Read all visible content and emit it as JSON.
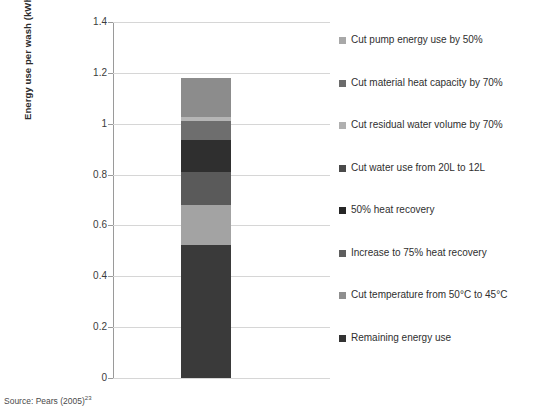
{
  "chart_data": {
    "type": "bar",
    "title": "",
    "xlabel": "",
    "ylabel": "Energy use per wash (kWh)",
    "ylim": [
      0,
      1.4
    ],
    "ytick_labels": [
      "1.4",
      "1.2",
      "1",
      "0.8",
      "0.6",
      "0.4",
      "0.2",
      "0"
    ],
    "ytick_values": [
      1.4,
      1.2,
      1.0,
      0.8,
      0.6,
      0.4,
      0.2,
      0
    ],
    "grid": true,
    "legend_position": "right",
    "stacked": true,
    "categories": [
      ""
    ],
    "total": 1.18,
    "series": [
      {
        "name": "Cut pump energy use by 50%",
        "values": [
          0.155
        ],
        "cumulative_top": 1.18,
        "color": "#8c8c8c"
      },
      {
        "name": "Cut material heat capacity by 70%",
        "values": [
          0.015
        ],
        "cumulative_top": 1.025,
        "color": "#b5b5b5"
      },
      {
        "name": "Cut residual water volume by 70%",
        "values": [
          0.075
        ],
        "cumulative_top": 1.01,
        "color": "#6e6e6e"
      },
      {
        "name": "Cut water use from 20L to 12L",
        "values": [
          0.125
        ],
        "cumulative_top": 0.935,
        "color": "#2f2f2f"
      },
      {
        "name": "50% heat recovery",
        "values": [
          0.13
        ],
        "cumulative_top": 0.81,
        "color": "#5a5a5a"
      },
      {
        "name": "Increase to 75% heat recovery",
        "values": [
          0.157
        ],
        "cumulative_top": 0.68,
        "color": "#a3a3a3"
      },
      {
        "name": "Cut temperature from 50°C to 45°C",
        "values": [
          0.0
        ],
        "cumulative_top": 0.523,
        "color": "#7d7d7d"
      },
      {
        "name": "Remaining energy use",
        "values": [
          0.523
        ],
        "cumulative_top": 0.523,
        "color": "#3a3a3a"
      }
    ]
  },
  "axis": {
    "y_title": "Energy use per wash (kWh)"
  },
  "legend": {
    "items": [
      {
        "label": "Cut pump energy use by 50%",
        "color": "#a8a8a8"
      },
      {
        "label": "Cut material heat capacity by 70%",
        "color": "#6b6b6b"
      },
      {
        "label": "Cut residual water volume by 70%",
        "color": "#b0b0b0"
      },
      {
        "label": "Cut water use from 20L to 12L",
        "color": "#4a4a4a"
      },
      {
        "label": "50% heat recovery",
        "color": "#262626"
      },
      {
        "label": "Increase to 75% heat recovery",
        "color": "#5e5e5e"
      },
      {
        "label": "Cut temperature from 50°C to 45°C",
        "color": "#8f8f8f"
      },
      {
        "label": "Remaining energy use",
        "color": "#333333"
      }
    ]
  },
  "source": {
    "text": "Source: Pears (2005)",
    "footnote": "23"
  }
}
